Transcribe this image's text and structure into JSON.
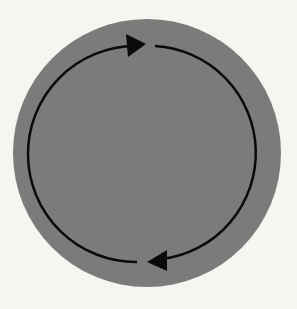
{
  "diagram": {
    "type": "cycle",
    "colors": {
      "background": "#f6f5ef",
      "disc": "#7b7b7b",
      "arrow": "#0a0a0a"
    },
    "disc": {
      "cx": 147,
      "cy": 153,
      "r": 134
    },
    "loop": {
      "cx": 147,
      "cy": 153,
      "r": 107,
      "direction": "clockwise"
    },
    "arrowheads": [
      {
        "position": "top",
        "pointing": "right"
      },
      {
        "position": "bottom",
        "pointing": "left"
      }
    ],
    "labels": []
  }
}
